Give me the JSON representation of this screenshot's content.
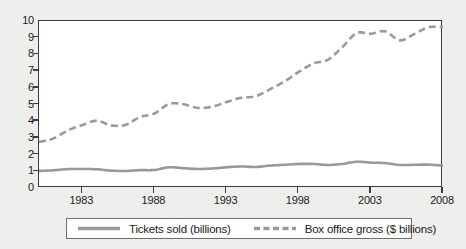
{
  "chart_data": {
    "type": "line",
    "title": "",
    "xlabel": "",
    "ylabel": "",
    "xlim": [
      1980,
      2008
    ],
    "ylim": [
      0,
      10
    ],
    "grid": false,
    "legend_position": "bottom",
    "x_tick_labels": [
      "1983",
      "1988",
      "1993",
      "1998",
      "2003",
      "2008"
    ],
    "x_tick_values": [
      1983,
      1988,
      1993,
      1998,
      2003,
      2008
    ],
    "y_tick_labels": [
      "0",
      "1",
      "2",
      "3",
      "4",
      "5",
      "6",
      "7",
      "8",
      "9",
      "10"
    ],
    "y_tick_values": [
      0,
      1,
      2,
      3,
      4,
      5,
      6,
      7,
      8,
      9,
      10
    ],
    "x": [
      1980,
      1981,
      1982,
      1983,
      1984,
      1985,
      1986,
      1987,
      1988,
      1989,
      1990,
      1991,
      1992,
      1993,
      1994,
      1995,
      1996,
      1997,
      1998,
      1999,
      2000,
      2001,
      2002,
      2003,
      2004,
      2005,
      2006,
      2007,
      2008
    ],
    "series": [
      {
        "name": "Tickets sold (billions)",
        "style": "solid",
        "color": "#999999",
        "values": [
          1.02,
          1.06,
          1.13,
          1.14,
          1.12,
          1.04,
          1.02,
          1.07,
          1.08,
          1.24,
          1.19,
          1.14,
          1.17,
          1.24,
          1.29,
          1.26,
          1.34,
          1.39,
          1.44,
          1.44,
          1.38,
          1.44,
          1.57,
          1.52,
          1.49,
          1.38,
          1.39,
          1.4,
          1.34
        ]
      },
      {
        "name": "Box office gross ($ billions)",
        "style": "dashed",
        "color": "#9a9a9a",
        "values": [
          2.75,
          2.97,
          3.45,
          3.77,
          4.03,
          3.75,
          3.78,
          4.25,
          4.46,
          5.03,
          5.02,
          4.8,
          4.87,
          5.15,
          5.4,
          5.49,
          5.91,
          6.37,
          6.95,
          7.45,
          7.67,
          8.41,
          9.27,
          9.24,
          9.38,
          8.84,
          9.21,
          9.63,
          9.63
        ]
      }
    ]
  },
  "legend": {
    "entries": [
      {
        "label": "Tickets sold (billions)",
        "style": "solid"
      },
      {
        "label": "Box office gross ($ billions)",
        "style": "dashed"
      }
    ]
  }
}
